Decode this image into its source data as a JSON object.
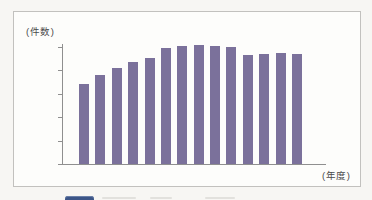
{
  "chart_data": {
    "type": "bar",
    "title": "",
    "y_unit_label": "(件数)",
    "x_unit_label": "(年度)",
    "categories": [
      "2010",
      "2011",
      "2012",
      "2013",
      "2014",
      "2015",
      "2016",
      "2017",
      "2018",
      "2019",
      "2020",
      "2021",
      "2022",
      "2023"
    ],
    "values": [
      3437,
      3800,
      4090,
      4350,
      4510,
      4950,
      5060,
      5091,
      5030,
      4990,
      4660,
      4710,
      4760,
      4710
    ],
    "ylim": [
      0,
      5000
    ],
    "ytick_values": [
      0,
      1000,
      2000,
      3000,
      4000,
      5000
    ],
    "ytick_labels": [
      "0",
      "1,000",
      "2,000",
      "3,000",
      "4,000",
      "5,000"
    ],
    "xtick_shown": [
      {
        "index": 0,
        "label": "2010"
      },
      {
        "index": 5,
        "label": "2015"
      },
      {
        "index": 10,
        "label": "2020"
      },
      {
        "index": 13,
        "label": "2023"
      }
    ],
    "annotations": [
      {
        "index": 0,
        "label": "3,437"
      },
      {
        "index": 7,
        "label": "5,091"
      }
    ],
    "bar_color": "#7b719b",
    "axis_color": "#8f8f8f",
    "grid": false,
    "legend_position": "bottom-cutoff"
  },
  "legend": {
    "swatch_color": "#3c5587",
    "note": ""
  }
}
